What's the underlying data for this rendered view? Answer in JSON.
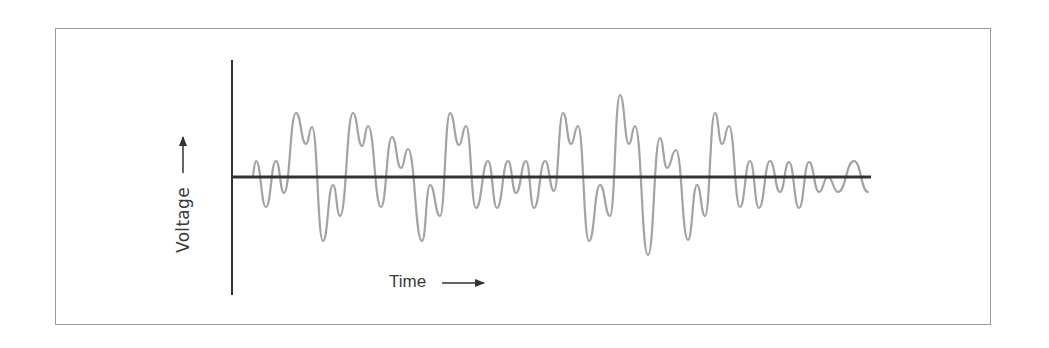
{
  "chart_data": {
    "type": "line",
    "title": "",
    "xlabel": "Time",
    "ylabel": "Voltage",
    "xlabel_arrow": "right-arrow",
    "ylabel_arrow": "up-arrow",
    "grid": false,
    "ticks": false,
    "legend": null,
    "colors": {
      "axis": "#333333",
      "waveform": "#a3a3a3",
      "frame": "#9a9a9a"
    },
    "pixel_geometry": {
      "y_axis": {
        "x": 232,
        "y_top": 60,
        "y_bottom": 295
      },
      "x_axis": {
        "y": 177,
        "x_start": 232,
        "x_end": 871
      }
    },
    "series": [
      {
        "name": "signal",
        "points_px": [
          [
            252,
            177
          ],
          [
            256,
            161
          ],
          [
            266,
            207
          ],
          [
            276,
            161
          ],
          [
            284,
            193
          ],
          [
            296,
            113
          ],
          [
            306,
            144
          ],
          [
            312,
            127
          ],
          [
            323,
            241
          ],
          [
            333,
            185
          ],
          [
            340,
            216
          ],
          [
            353,
            113
          ],
          [
            362,
            146
          ],
          [
            368,
            126
          ],
          [
            381,
            207
          ],
          [
            392,
            137
          ],
          [
            401,
            168
          ],
          [
            408,
            149
          ],
          [
            422,
            241
          ],
          [
            430,
            185
          ],
          [
            440,
            216
          ],
          [
            450,
            113
          ],
          [
            459,
            145
          ],
          [
            466,
            126
          ],
          [
            476,
            208
          ],
          [
            488,
            161
          ],
          [
            497,
            208
          ],
          [
            508,
            161
          ],
          [
            516,
            193
          ],
          [
            526,
            161
          ],
          [
            534,
            208
          ],
          [
            545,
            161
          ],
          [
            554,
            191
          ],
          [
            563,
            113
          ],
          [
            571,
            144
          ],
          [
            578,
            126
          ],
          [
            589,
            241
          ],
          [
            600,
            185
          ],
          [
            610,
            216
          ],
          [
            620,
            95
          ],
          [
            629,
            144
          ],
          [
            635,
            126
          ],
          [
            648,
            255
          ],
          [
            660,
            138
          ],
          [
            667,
            168
          ],
          [
            676,
            150
          ],
          [
            688,
            240
          ],
          [
            697,
            185
          ],
          [
            705,
            216
          ],
          [
            715,
            113
          ],
          [
            722,
            144
          ],
          [
            729,
            126
          ],
          [
            740,
            207
          ],
          [
            750,
            161
          ],
          [
            759,
            208
          ],
          [
            770,
            161
          ],
          [
            780,
            192
          ],
          [
            789,
            162
          ],
          [
            799,
            208
          ],
          [
            809,
            162
          ],
          [
            819,
            192
          ],
          [
            828,
            177
          ],
          [
            838,
            192
          ],
          [
            854,
            161
          ],
          [
            868,
            192
          ]
        ]
      }
    ]
  },
  "labels": {
    "ylabel": "Voltage",
    "xlabel": "Time"
  }
}
